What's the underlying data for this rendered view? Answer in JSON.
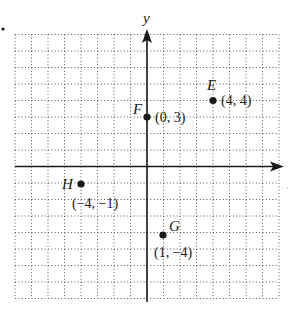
{
  "chart_data": {
    "type": "scatter",
    "title": "",
    "xlabel": "",
    "ylabel": "y",
    "xlim": [
      -8,
      8
    ],
    "ylim": [
      -8,
      8
    ],
    "grid": true,
    "grid_style": "dotted",
    "points": [
      {
        "name": "E",
        "x": 4,
        "y": 4,
        "coord_label": "(4, 4)"
      },
      {
        "name": "F",
        "x": 0,
        "y": 3,
        "coord_label": "(0, 3)"
      },
      {
        "name": "H",
        "x": -4,
        "y": -1,
        "coord_label": "(−4, −1)"
      },
      {
        "name": "G",
        "x": 1,
        "y": -4,
        "coord_label": "(1, −4)"
      }
    ]
  },
  "axes": {
    "y_label": "y"
  },
  "colors": {
    "ink": "#1a1a1a",
    "grid": "#555555",
    "background": "#ffffff"
  }
}
